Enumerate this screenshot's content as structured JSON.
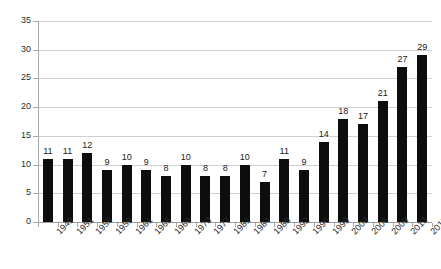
{
  "chart_data": {
    "type": "bar",
    "title": "",
    "subtitle": "",
    "xlabel": "",
    "ylabel": "",
    "categories": [
      "1949",
      "1951",
      "1955",
      "1959",
      "1961",
      "1965",
      "1969",
      "1973",
      "1977",
      "1981",
      "1984",
      "1988",
      "1992",
      "1996",
      "1999",
      "2003",
      "2006",
      "2009",
      "2013",
      "2015"
    ],
    "values": [
      11,
      11,
      12,
      9,
      10,
      9,
      8,
      10,
      8,
      8,
      10,
      7,
      11,
      9,
      14,
      18,
      17,
      21,
      27,
      29
    ],
    "data_labels": [
      "11",
      "11",
      "12",
      "9",
      "10",
      "9",
      "8",
      "10",
      "8",
      "8",
      "10",
      "7",
      "11",
      "9",
      "14",
      "18",
      "17",
      "21",
      "27",
      "29"
    ],
    "ylim": [
      0,
      35
    ],
    "ytick_values": [
      0,
      5,
      10,
      15,
      20,
      25,
      30,
      35
    ],
    "ytick_labels": [
      "0",
      "5",
      "10",
      "15",
      "20",
      "25",
      "30",
      "35"
    ],
    "grid": true,
    "grid_axis": "y",
    "legend": false,
    "legend_position": "none",
    "series": [
      {
        "name": "",
        "color": "#0d0d0d",
        "values": [
          11,
          11,
          12,
          9,
          10,
          9,
          8,
          10,
          8,
          8,
          10,
          7,
          11,
          9,
          14,
          18,
          17,
          21,
          27,
          29
        ]
      }
    ],
    "annotations": []
  },
  "colors": {
    "bar": "#0d0d0d",
    "gridline": "#d0d0d0",
    "axis": "#a8a8a8",
    "baseline": "#9a9a9a",
    "background": "#ffffff",
    "text": "#2b2b2b"
  }
}
